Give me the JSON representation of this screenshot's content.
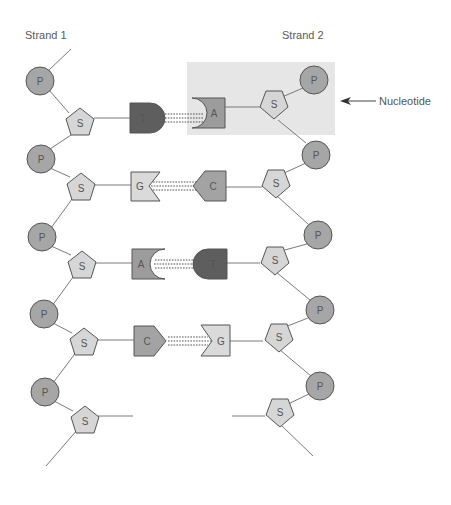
{
  "labels": {
    "strand1": "Strand 1",
    "strand2": "Strand 2",
    "nucleotide": "Nucleotide"
  },
  "components": {
    "phosphate": "P",
    "sugar": "S"
  },
  "colors": {
    "phosphate": "#a6a6a6",
    "sugar": "#d6d6d6",
    "highlight": "#e6e6e6",
    "T": "#5e5e5e",
    "A": "#9c9c9c",
    "G": "#dadada",
    "C": "#a3a3a3",
    "outline": "#555555"
  },
  "base_pairs": [
    {
      "left": "T",
      "right": "A"
    },
    {
      "left": "G",
      "right": "C"
    },
    {
      "left": "A",
      "right": "T"
    },
    {
      "left": "C",
      "right": "G"
    }
  ]
}
